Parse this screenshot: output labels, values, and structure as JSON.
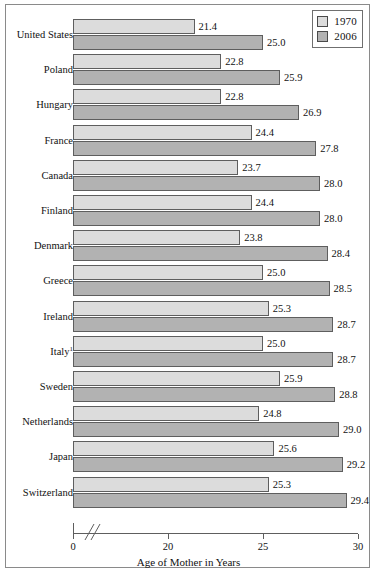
{
  "chart_data": {
    "type": "bar",
    "orientation": "horizontal",
    "title": "",
    "xlabel": "Age of Mother in Years",
    "ylabel": "",
    "categories": [
      "United States",
      "Poland",
      "Hungary",
      "France",
      "Canada",
      "Finland",
      "Denmark",
      "Greece",
      "Ireland",
      "Italy",
      "Sweden",
      "Netherlands",
      "Japan",
      "Switzerland"
    ],
    "category_footnotes": {
      "Italy": "1"
    },
    "series": [
      {
        "name": "1970",
        "color": "#dcdcdc",
        "values": [
          21.4,
          22.8,
          22.8,
          24.4,
          23.7,
          24.4,
          23.8,
          25.0,
          25.3,
          25.0,
          25.9,
          24.8,
          25.6,
          25.3
        ]
      },
      {
        "name": "2006",
        "color": "#b2b2b2",
        "values": [
          25.0,
          25.9,
          26.9,
          27.8,
          28.0,
          28.0,
          28.4,
          28.5,
          28.7,
          28.7,
          28.8,
          29.0,
          29.2,
          29.4
        ]
      }
    ],
    "xticks": [
      0,
      20,
      25,
      30
    ],
    "xtick_labels": [
      "0",
      "20",
      "25",
      "30"
    ],
    "xlim": [
      20,
      30
    ],
    "axis_break": true,
    "axis_break_note": "x-axis is broken between 0 and 20",
    "grid": false,
    "legend_position": "top-right",
    "value_labels": true,
    "value_label_format": "one-decimal"
  },
  "legend": {
    "entries": [
      {
        "label": "1970",
        "color": "#dcdcdc"
      },
      {
        "label": "2006",
        "color": "#b2b2b2"
      }
    ]
  },
  "axis": {
    "xlabel": "Age of Mother in Years",
    "ticks": [
      "0",
      "20",
      "25",
      "30"
    ]
  }
}
